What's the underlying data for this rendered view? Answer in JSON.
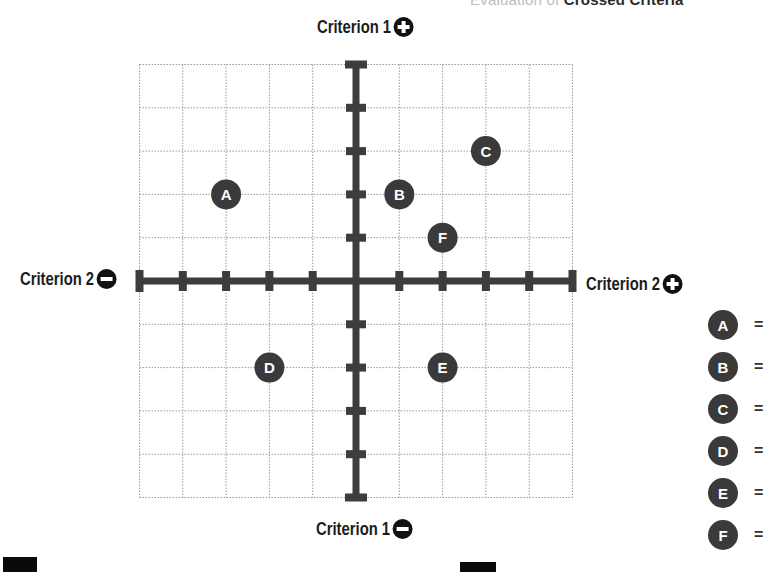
{
  "header": {
    "partial_title_light": "Evaluation of ",
    "partial_title_bold": "Crossed Criteria"
  },
  "axes": {
    "top": {
      "label": "Criterion 1",
      "sign": "plus-circle-icon"
    },
    "bottom": {
      "label": "Criterion 1",
      "sign": "minus-circle-icon"
    },
    "left": {
      "label": "Criterion 2",
      "sign": "minus-circle-icon"
    },
    "right": {
      "label": "Criterion 2",
      "sign": "plus-circle-icon"
    }
  },
  "colors": {
    "axis": "#3d3d3d",
    "grid": "#9a9a9a",
    "marker": "#3a3a3a",
    "marker_text": "#ffffff"
  },
  "legend": {
    "items": [
      {
        "letter": "A",
        "eq": "="
      },
      {
        "letter": "B",
        "eq": "="
      },
      {
        "letter": "C",
        "eq": "="
      },
      {
        "letter": "D",
        "eq": "="
      },
      {
        "letter": "E",
        "eq": "="
      },
      {
        "letter": "F",
        "eq": "="
      }
    ]
  },
  "chart_data": {
    "type": "scatter",
    "title": "",
    "xlabel": "Criterion 2",
    "ylabel": "Criterion 1",
    "xlim": [
      -5,
      5
    ],
    "ylim": [
      -5,
      5
    ],
    "grid": true,
    "points": [
      {
        "label": "A",
        "x": -3,
        "y": 2
      },
      {
        "label": "B",
        "x": 1,
        "y": 2
      },
      {
        "label": "C",
        "x": 3,
        "y": 3
      },
      {
        "label": "D",
        "x": -2,
        "y": -2
      },
      {
        "label": "E",
        "x": 2,
        "y": -2
      },
      {
        "label": "F",
        "x": 2,
        "y": 1
      }
    ]
  }
}
